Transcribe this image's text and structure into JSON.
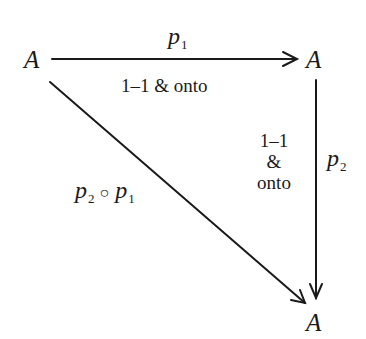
{
  "diagram": {
    "type": "commutative-diagram",
    "nodes": [
      {
        "id": "top-left",
        "label": "A"
      },
      {
        "id": "top-right",
        "label": "A"
      },
      {
        "id": "bottom-right",
        "label": "A"
      }
    ],
    "edges": [
      {
        "from": "top-left",
        "to": "top-right",
        "label": "p",
        "label_sub": "1",
        "annotation": "1–1 & onto"
      },
      {
        "from": "top-right",
        "to": "bottom-right",
        "label": "p",
        "label_sub": "2",
        "annotation_lines": [
          "1–1",
          "&",
          "onto"
        ]
      },
      {
        "from": "top-left",
        "to": "bottom-right",
        "label_parts": [
          "p",
          "2",
          "○",
          "p",
          "1"
        ]
      }
    ]
  }
}
